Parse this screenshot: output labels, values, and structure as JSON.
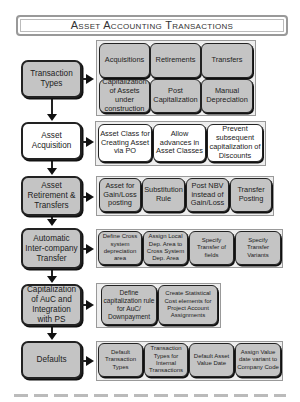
{
  "title": "Asset Accounting Transactions",
  "steps": [
    {
      "label": "Transaction Types",
      "style": "grey",
      "items": [
        "Acquisitions",
        "Retirements",
        "Transfers",
        "Capitalization of Assets under construction",
        "Post Capitalization",
        "Manual Depreciation"
      ]
    },
    {
      "label": "Asset Acquisition",
      "style": "white",
      "items": [
        "Asset Class for Creating Asset via PO",
        "Allow advances in Asset Classes",
        "Prevent subsequent capitalization of Discounts"
      ]
    },
    {
      "label": "Asset Retirement & Transfers",
      "style": "grey",
      "items": [
        "Asset for Gain/Loss posting",
        "Substitution Rule",
        "Post NBV instead of Gain/Loss",
        "Transfer Posting"
      ]
    },
    {
      "label": "Automatic Inter-company Transfer",
      "style": "grey",
      "items": [
        "Define Cross system depreciation area",
        "Assign Local Dep. Area to Cross System Dep. Area",
        "Specify Transfer of fields",
        "Specify Transfer Variants"
      ]
    },
    {
      "label": "Capitalization of AuC and Integration with PS",
      "style": "grey",
      "items": [
        "Define capitalization rule for AuC/ Downpayment",
        "Create Statistical Cost elements for Project Account Assignments"
      ]
    },
    {
      "label": "Defaults",
      "style": "grey",
      "items": [
        "Default Transaction Types",
        "Transaction Types for Internal Transactions",
        "Default Asset Value Date",
        "Assign Value date variant to Company Code"
      ]
    }
  ]
}
